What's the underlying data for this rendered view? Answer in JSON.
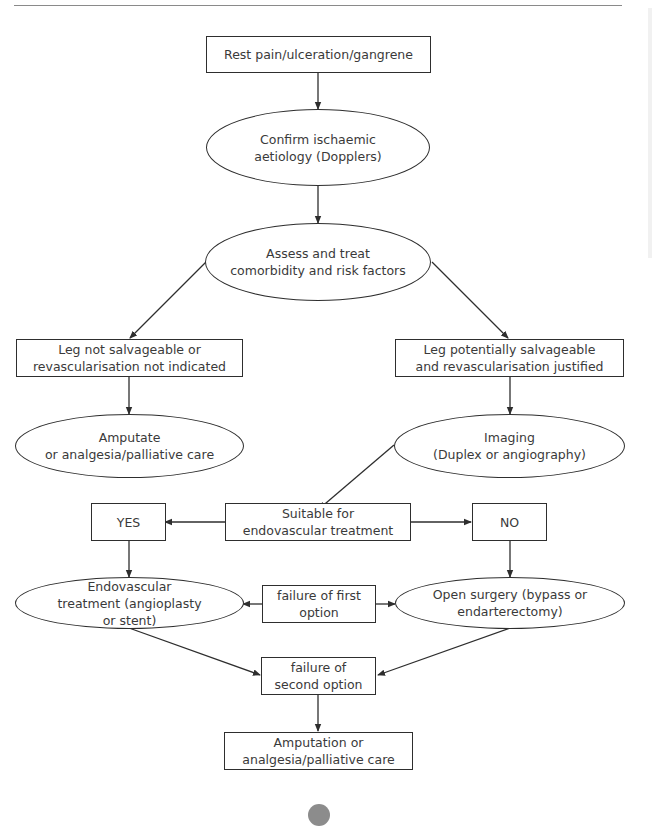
{
  "diagram": {
    "nodes": [
      {
        "id": "rest_pain",
        "shape": "rect",
        "label": "Rest pain/ulceration/gangrene"
      },
      {
        "id": "confirm",
        "shape": "ellipse",
        "label": "Confirm ischaemic\naetiology (Dopplers)"
      },
      {
        "id": "assess",
        "shape": "ellipse",
        "label": "Assess and treat\ncomorbidity and risk factors"
      },
      {
        "id": "not_salvageable",
        "shape": "rect",
        "label": "Leg not salvageable or\nrevascularisation not indicated"
      },
      {
        "id": "salvageable",
        "shape": "rect",
        "label": "Leg potentially salvageable\nand revascularisation justified"
      },
      {
        "id": "amputate",
        "shape": "ellipse",
        "label": "Amputate\nor analgesia/palliative care"
      },
      {
        "id": "imaging",
        "shape": "ellipse",
        "label": "Imaging\n(Duplex or angiography)"
      },
      {
        "id": "suitable",
        "shape": "rect",
        "label": "Suitable for\nendovascular treatment"
      },
      {
        "id": "yes",
        "shape": "rect",
        "label": "YES"
      },
      {
        "id": "no",
        "shape": "rect",
        "label": "NO"
      },
      {
        "id": "endovascular",
        "shape": "ellipse",
        "label": "Endovascular\ntreatment (angioplasty\nor stent)"
      },
      {
        "id": "failure_first",
        "shape": "rect",
        "label": "failure of first\noption"
      },
      {
        "id": "open_surgery",
        "shape": "ellipse",
        "label": "Open surgery (bypass or\nendarterectomy)"
      },
      {
        "id": "failure_second",
        "shape": "rect",
        "label": "failure of\nsecond option"
      },
      {
        "id": "amputation_final",
        "shape": "rect",
        "label": "Amputation or\nanalgesia/palliative care"
      }
    ],
    "edges": [
      {
        "from": "rest_pain",
        "to": "confirm"
      },
      {
        "from": "confirm",
        "to": "assess"
      },
      {
        "from": "assess",
        "to": "not_salvageable"
      },
      {
        "from": "assess",
        "to": "salvageable"
      },
      {
        "from": "not_salvageable",
        "to": "amputate"
      },
      {
        "from": "salvageable",
        "to": "imaging"
      },
      {
        "from": "imaging",
        "to": "suitable"
      },
      {
        "from": "suitable",
        "to": "yes"
      },
      {
        "from": "suitable",
        "to": "no"
      },
      {
        "from": "yes",
        "to": "endovascular"
      },
      {
        "from": "no",
        "to": "open_surgery"
      },
      {
        "from": "failure_first",
        "to": "endovascular"
      },
      {
        "from": "failure_first",
        "to": "open_surgery"
      },
      {
        "from": "endovascular",
        "to": "failure_second"
      },
      {
        "from": "open_surgery",
        "to": "failure_second"
      },
      {
        "from": "failure_second",
        "to": "amputation_final"
      }
    ]
  },
  "colors": {
    "line": "#2e2e2e",
    "text": "#3a3a3a",
    "rule": "#8a8a8a",
    "page_dot": "#8c8c8c"
  }
}
